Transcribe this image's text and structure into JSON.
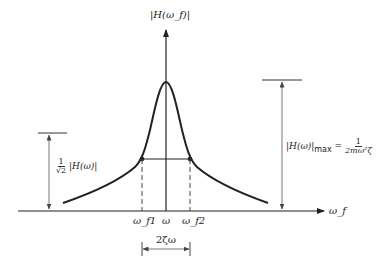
{
  "diagram": {
    "y_axis_label": "|H(ω_f)|",
    "x_axis_label": "ω_f",
    "x_ticks": {
      "omega_f1": "ω_f1",
      "omega": "ω",
      "omega_f2": "ω_f2"
    },
    "bandwidth_label": "2ζω",
    "half_power_label": {
      "numerator": "1",
      "denominator": "√2",
      "text": "|H(ω)|"
    },
    "max_label": {
      "lhs": "|H(ω)|",
      "sub": "max",
      "equals": "=",
      "numerator": "1",
      "denominator": "2mω²ζ"
    },
    "curve": {
      "peak": 1.0,
      "half_power_level": 0.7071,
      "description": "resonance peak at ω, half-power points at ω_f1 and ω_f2"
    },
    "colors": {
      "line": "#222222",
      "dashed": "#444444",
      "dim": "#555555"
    }
  }
}
